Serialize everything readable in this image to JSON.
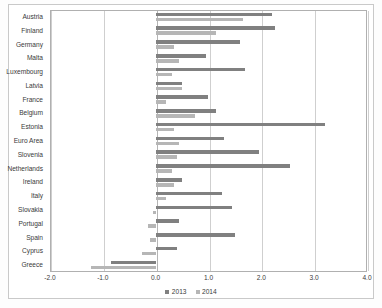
{
  "chart_data": {
    "type": "bar",
    "orientation": "horizontal",
    "title": "",
    "subtitle": "",
    "xlabel": "",
    "ylabel": "",
    "xlim": [
      -2.0,
      4.0
    ],
    "xticks": [
      -2.0,
      -1.0,
      0.0,
      1.0,
      2.0,
      3.0,
      4.0
    ],
    "xtick_labels": [
      "-2.0",
      "-1.0",
      "0.0",
      "1.0",
      "2.0",
      "3.0",
      "4.0"
    ],
    "grid": true,
    "legend_position": "bottom",
    "categories": [
      "Austria",
      "Finland",
      "Germany",
      "Malta",
      "Luxembourg",
      "Latvia",
      "France",
      "Belgium",
      "Estonia",
      "Euro Area",
      "Slovenia",
      "Netherlands",
      "Ireland",
      "Italy",
      "Slovakia",
      "Portugal",
      "Spain",
      "Cyprus",
      "Greece"
    ],
    "series": [
      {
        "name": "2013",
        "color": "#808080",
        "values": [
          2.2,
          2.25,
          1.6,
          0.95,
          1.7,
          0.5,
          1.0,
          1.15,
          3.2,
          1.3,
          1.95,
          2.55,
          0.5,
          1.25,
          1.45,
          0.45,
          1.5,
          0.4,
          -0.85
        ]
      },
      {
        "name": "2014",
        "color": "#b6b6b6",
        "values": [
          1.65,
          1.15,
          0.35,
          0.45,
          0.3,
          0.5,
          0.2,
          0.75,
          0.35,
          0.45,
          0.4,
          0.3,
          0.35,
          0.2,
          -0.05,
          -0.15,
          -0.1,
          -0.25,
          -1.23
        ]
      }
    ],
    "legend": [
      "2013",
      "2014"
    ]
  }
}
